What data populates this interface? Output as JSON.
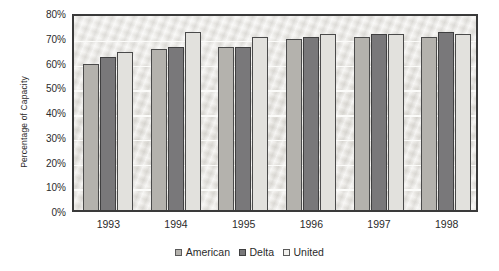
{
  "chart_data": {
    "type": "bar",
    "title": "",
    "xlabel": "",
    "ylabel": "Percentage of Capacity",
    "categories": [
      "1993",
      "1994",
      "1995",
      "1996",
      "1997",
      "1998"
    ],
    "series": [
      {
        "name": "American",
        "color": "#b4b2ad",
        "values": [
          59,
          65,
          66,
          69,
          70,
          70
        ]
      },
      {
        "name": "Delta",
        "color": "#79787a",
        "values": [
          62,
          66,
          66,
          70,
          71,
          72
        ]
      },
      {
        "name": "United",
        "color": "#e2e1dd",
        "values": [
          64,
          72,
          70,
          71,
          71,
          71
        ]
      }
    ],
    "ylim": [
      0,
      80
    ],
    "ytick_step": 10,
    "ytick_labels": [
      "80%",
      "70%",
      "60%",
      "50%",
      "40%",
      "30%",
      "20%",
      "10%",
      "0%"
    ],
    "ytick_values": [
      80,
      70,
      60,
      50,
      40,
      30,
      20,
      10,
      0
    ],
    "y_unit": "%",
    "grid": true,
    "grid_axis": "y",
    "legend_position": "bottom-center",
    "plot_background": "#eceae6",
    "plot_border_color": "#3a3a3a",
    "text_color": "#2b2b2b"
  },
  "legend": {
    "entries": [
      {
        "label": "American"
      },
      {
        "label": "Delta"
      },
      {
        "label": "United"
      }
    ]
  }
}
